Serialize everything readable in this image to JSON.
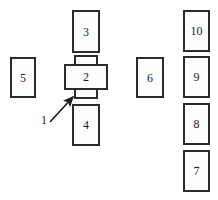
{
  "diagram": {
    "type": "technical-line-drawing",
    "background_color": "#ffffff",
    "stroke_color": "#2b2b2b",
    "fill_color": "#fefefe",
    "label_color": "#1a1a1a",
    "parts": [
      {
        "id": "part-2",
        "label": "2",
        "role": "central-body",
        "x": 64,
        "y": 64,
        "width": 44,
        "height": 26
      },
      {
        "id": "part-3",
        "label": "3",
        "role": "upper-module",
        "x": 72,
        "y": 10,
        "width": 28,
        "height": 43
      },
      {
        "id": "part-4",
        "label": "4",
        "role": "lower-module",
        "x": 72,
        "y": 104,
        "width": 28,
        "height": 42
      },
      {
        "id": "part-5",
        "label": "5",
        "role": "left-module",
        "x": 10,
        "y": 57,
        "width": 26,
        "height": 41
      },
      {
        "id": "part-6",
        "label": "6",
        "role": "middle-right-module",
        "x": 136,
        "y": 57,
        "width": 28,
        "height": 41
      },
      {
        "id": "part-10",
        "label": "10",
        "role": "right-column-module",
        "x": 183,
        "y": 10,
        "width": 27,
        "height": 42
      },
      {
        "id": "part-9",
        "label": "9",
        "role": "right-column-module",
        "x": 183,
        "y": 56,
        "width": 27,
        "height": 42
      },
      {
        "id": "part-8",
        "label": "8",
        "role": "right-column-module",
        "x": 183,
        "y": 103,
        "width": 27,
        "height": 42
      },
      {
        "id": "part-7",
        "label": "7",
        "role": "right-column-module",
        "x": 183,
        "y": 150,
        "width": 27,
        "height": 42
      }
    ],
    "stubs": [
      {
        "id": "stub-upper",
        "role": "upper-neck-of-part-2",
        "x": 74,
        "y": 55,
        "width": 24,
        "height": 11
      },
      {
        "id": "stub-lower",
        "role": "lower-neck-of-part-2",
        "x": 74,
        "y": 88,
        "width": 24,
        "height": 11
      }
    ],
    "callout": {
      "label": "1",
      "label_x": 41,
      "label_y": 114,
      "line_start_x": 50,
      "line_start_y": 122,
      "line_end_x": 74,
      "line_end_y": 96
    }
  }
}
